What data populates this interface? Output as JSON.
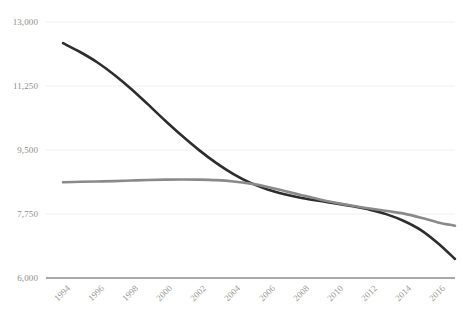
{
  "chart_data": {
    "type": "line",
    "title": "",
    "subtitle": "",
    "xlabel": "",
    "ylabel": "",
    "grid": true,
    "legend": "none",
    "xlim": [
      1993,
      2017
    ],
    "ylim": [
      6000,
      13000
    ],
    "y_ticks": [
      6000,
      7750,
      9500,
      11250,
      13000
    ],
    "y_tick_labels": [
      "6,000",
      "7,750",
      "9,500",
      "11,250",
      "13,000"
    ],
    "x_ticks": [
      1994,
      1996,
      1998,
      2000,
      2002,
      2004,
      2006,
      2008,
      2010,
      2012,
      2014,
      2016
    ],
    "x_tick_labels": [
      "1994",
      "1996",
      "1998",
      "2000",
      "2002",
      "2004",
      "2006",
      "2008",
      "2010",
      "2012",
      "2014",
      "2016"
    ],
    "x": [
      1994,
      1995,
      1996,
      1997,
      1998,
      1999,
      2000,
      2001,
      2002,
      2003,
      2004,
      2005,
      2006,
      2007,
      2008,
      2009,
      2010,
      2011,
      2012,
      2013,
      2014,
      2015,
      2016,
      2017
    ],
    "series": [
      {
        "name": "series-dark",
        "color": "#2d2d2d",
        "width": 2.6,
        "values": [
          12420,
          12180,
          11900,
          11560,
          11170,
          10740,
          10300,
          9880,
          9490,
          9140,
          8840,
          8600,
          8420,
          8290,
          8190,
          8110,
          8040,
          7960,
          7870,
          7740,
          7560,
          7310,
          6950,
          6520
        ]
      },
      {
        "name": "series-gray",
        "color": "#8a8a8a",
        "width": 2.6,
        "values": [
          8620,
          8630,
          8640,
          8650,
          8665,
          8680,
          8690,
          8695,
          8690,
          8675,
          8640,
          8580,
          8490,
          8380,
          8265,
          8155,
          8060,
          7975,
          7900,
          7830,
          7760,
          7650,
          7520,
          7430
        ]
      }
    ]
  },
  "axes": {
    "baseline_color": "#8c8c8c",
    "gridline_color": "#f0f0f0",
    "tick_label_color": "#8d8d8d"
  }
}
